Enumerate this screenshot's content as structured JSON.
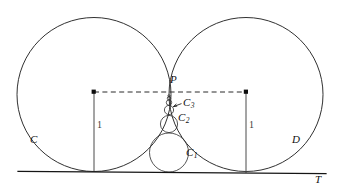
{
  "figure": {
    "type": "geometry-diagram",
    "canvas": {
      "width": 338,
      "height": 194,
      "background": "#ffffff"
    },
    "stroke_color": "#1a1a1a",
    "labels": [
      {
        "id": "label-C",
        "text": "C",
        "sub": "",
        "x": 33,
        "y": 141,
        "kind": "circle-name"
      },
      {
        "id": "label-D",
        "text": "D",
        "sub": "",
        "x": 294,
        "y": 141,
        "kind": "circle-name"
      },
      {
        "id": "label-T",
        "text": "T",
        "sub": "",
        "x": 316,
        "y": 177,
        "kind": "line-name"
      },
      {
        "id": "label-P",
        "text": "P",
        "sub": "",
        "x": 172,
        "y": 78,
        "kind": "point-name"
      },
      {
        "id": "label-C1",
        "text": "C",
        "sub": "1",
        "x": 188,
        "y": 152,
        "kind": "circle-name"
      },
      {
        "id": "label-C2",
        "text": "C",
        "sub": "2",
        "x": 180,
        "y": 117,
        "kind": "circle-name"
      },
      {
        "id": "label-C3",
        "text": "C",
        "sub": "3",
        "x": 185,
        "y": 101,
        "kind": "circle-name"
      },
      {
        "id": "label-radius-left",
        "text": "1",
        "sub": "",
        "x": 97,
        "y": 125,
        "kind": "measure"
      },
      {
        "id": "label-radius-right",
        "text": "1",
        "sub": "",
        "x": 249,
        "y": 125,
        "kind": "measure"
      }
    ],
    "tangent_line": {
      "name": "T",
      "x1": 18,
      "y1": 171.5,
      "x2": 326,
      "y2": 173.5
    },
    "big_circles": [
      {
        "name": "C",
        "cx": 94,
        "cy": 94.5,
        "r": 77,
        "radius_label": "1"
      },
      {
        "name": "D",
        "cx": 246,
        "cy": 94.5,
        "r": 77,
        "radius_label": "1"
      }
    ],
    "tangency_point": {
      "name": "P",
      "x": 170,
      "y": 92
    },
    "chain_circles": [
      {
        "name": "C1",
        "cx": 169,
        "cy": 152.5,
        "r": 19.5
      },
      {
        "name": "C2",
        "cx": 169,
        "cy": 124.0,
        "r": 8.6
      },
      {
        "name": "C3",
        "cx": 169,
        "cy": 110.0,
        "r": 4.6
      },
      {
        "name": "C4",
        "cx": 169,
        "cy": 102.6,
        "r": 2.7
      },
      {
        "name": "C5",
        "cx": 169,
        "cy": 98.3,
        "r": 1.7
      },
      {
        "name": "C6",
        "cx": 169,
        "cy": 95.8,
        "r": 1.1
      }
    ],
    "center_chord": {
      "x1": 94,
      "y1": 92,
      "x2": 246,
      "y2": 92,
      "style": "dashed"
    },
    "radius_segments": [
      {
        "x": 94,
        "y1": 92,
        "y2": 172,
        "label": "1"
      },
      {
        "x": 246,
        "y1": 92,
        "y2": 172,
        "label": "1"
      }
    ],
    "center_dots": [
      {
        "x": 94,
        "y": 92
      },
      {
        "x": 246,
        "y": 92
      }
    ],
    "pointer": {
      "from_x": 181,
      "from_y": 104,
      "to_x": 173,
      "to_y": 107
    }
  }
}
